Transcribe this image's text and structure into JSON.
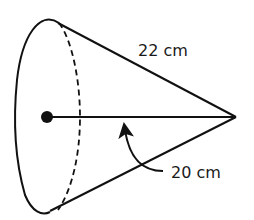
{
  "diagram": {
    "type": "cone",
    "orientation": "apex-right",
    "labels": {
      "slant_height": "22 cm",
      "height": "20 cm"
    },
    "elements": [
      {
        "name": "base-ellipse-front",
        "style": "solid"
      },
      {
        "name": "base-ellipse-back",
        "style": "dashed"
      },
      {
        "name": "slant-top",
        "style": "solid"
      },
      {
        "name": "slant-bottom",
        "style": "solid"
      },
      {
        "name": "height-line",
        "style": "solid"
      },
      {
        "name": "center-dot",
        "style": "filled"
      },
      {
        "name": "height-pointer-arrow",
        "style": "curved-arrow"
      }
    ],
    "colors": {
      "stroke": "#111111",
      "background": "#ffffff"
    }
  }
}
